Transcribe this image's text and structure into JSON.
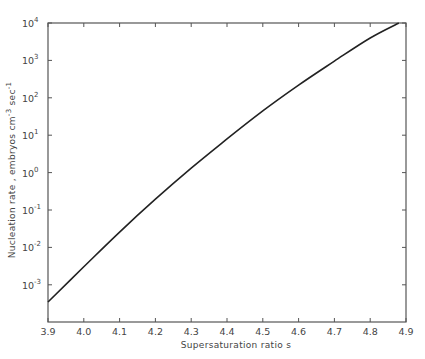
{
  "chart_data": {
    "type": "line",
    "title": "",
    "xlabel": "Supersaturation ratio  s",
    "ylabel": "Nucleation rate , embryos  cm^-3 sec^-1",
    "ylabel_parts": {
      "main": "Nucleation rate ,  embryos   cm",
      "cm_exp": "-3",
      "sec": " sec",
      "sec_exp": "-1"
    },
    "xscale": "linear",
    "yscale": "log",
    "xlim": [
      3.9,
      4.9
    ],
    "ylim_log10": [
      -3.6,
      4
    ],
    "x_ticks": [
      "3.9",
      "4.0",
      "4.1",
      "4.2",
      "4.3",
      "4.4",
      "4.5",
      "4.6",
      "4.7",
      "4.8",
      "4.9"
    ],
    "y_ticks": [
      {
        "base": "10",
        "exp": "4",
        "log": 4
      },
      {
        "base": "10",
        "exp": "3",
        "log": 3
      },
      {
        "base": "10",
        "exp": "2",
        "log": 2
      },
      {
        "base": "10",
        "exp": "1",
        "log": 1
      },
      {
        "base": "10",
        "exp": "0",
        "log": 0
      },
      {
        "base": "10",
        "exp": "-1",
        "log": -1
      },
      {
        "base": "10",
        "exp": "-2",
        "log": -2
      },
      {
        "base": "10",
        "exp": "-3",
        "log": -3
      }
    ],
    "grid": false,
    "legend": null,
    "series": [
      {
        "name": "Nucleation rate",
        "x": [
          3.9,
          4.0,
          4.1,
          4.2,
          4.3,
          4.4,
          4.5,
          4.6,
          4.7,
          4.8,
          4.88
        ],
        "log10_y": [
          -3.46,
          -2.52,
          -1.59,
          -0.71,
          0.12,
          0.9,
          1.65,
          2.34,
          2.98,
          3.6,
          4.0
        ],
        "y": [
          0.00035,
          0.003,
          0.026,
          0.19,
          1.3,
          7.9,
          45,
          220,
          950,
          4000,
          10000
        ],
        "color": "#222222"
      }
    ]
  }
}
